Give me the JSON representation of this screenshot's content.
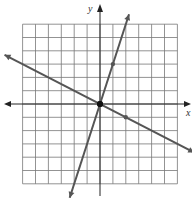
{
  "chart_data": {
    "type": "line",
    "title": "",
    "xlabel": "x",
    "ylabel": "y",
    "xlim": [
      -6,
      6
    ],
    "ylim": [
      -6,
      6
    ],
    "grid": true,
    "grid_step": 1,
    "series": [
      {
        "name": "steep line",
        "slope": 3,
        "intercept": 0,
        "marked_points": [
          [
            0,
            0
          ],
          [
            1,
            3
          ]
        ],
        "color": "#555555"
      },
      {
        "name": "shallow line",
        "slope": -0.5,
        "intercept": 0,
        "marked_points": [
          [
            0,
            0
          ],
          [
            2,
            -1
          ]
        ],
        "color": "#555555"
      }
    ],
    "intersection": [
      0,
      0
    ]
  },
  "labels": {
    "x_axis": "x",
    "y_axis": "y"
  }
}
